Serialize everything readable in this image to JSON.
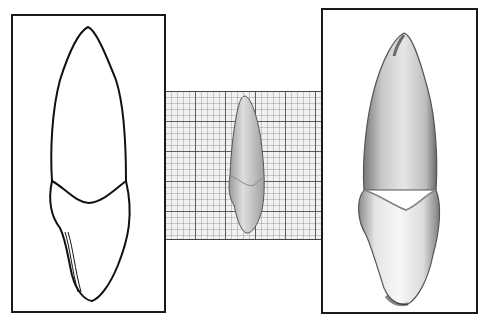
{
  "figure": {
    "panels": [
      {
        "id": "outline-drawing",
        "kind": "line drawing of tooth (labial view)"
      },
      {
        "id": "specimen-on-graph-paper",
        "kind": "photograph of tooth on millimeter grid paper"
      },
      {
        "id": "enlarged-photograph",
        "kind": "enlarged photograph of tooth"
      }
    ]
  },
  "colors": {
    "frame_border": "#1a1a1a",
    "grid_paper": "#f1f1f1",
    "grid_major": "#3c3c3c",
    "tooth_light": "#f2f2f2",
    "tooth_shadow": "#6e6e6e"
  }
}
